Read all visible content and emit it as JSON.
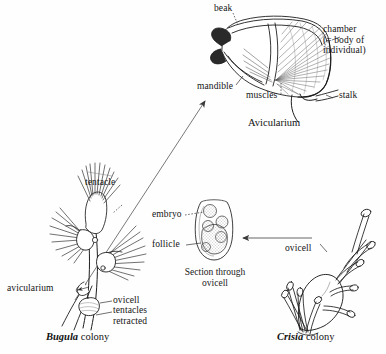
{
  "figure": {
    "background_color": "#fefefe",
    "ink_color": "#1a1a1a"
  },
  "avicularium": {
    "caption": "Avicularium",
    "labels": {
      "beak": "beak",
      "mandible": "mandible",
      "muscles": "muscles",
      "stalk": "stalk",
      "chamber_line1": "chamber",
      "chamber_line2": "(= body of",
      "chamber_line3": "individual)"
    }
  },
  "bugula": {
    "caption_species": "Bugula",
    "caption_rest": " colony",
    "labels": {
      "tentacle": "tentacle",
      "avicularium": "avicularium",
      "ovicell": "ovicell",
      "tentacles_retracted_line1": "tentacles",
      "tentacles_retracted_line2": "retracted"
    }
  },
  "ovicell_section": {
    "caption_line1": "Section through",
    "caption_line2": "ovicell",
    "labels": {
      "embryo": "embryo",
      "follicle": "follicle"
    }
  },
  "crisia": {
    "caption_species": "Crisia",
    "caption_rest": " colony",
    "labels": {
      "ovicell": "ovicell"
    }
  }
}
